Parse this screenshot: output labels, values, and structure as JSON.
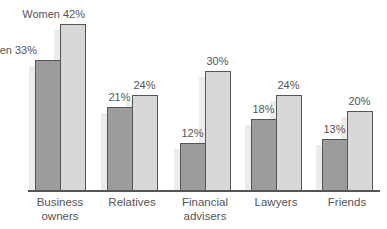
{
  "chart_data": {
    "type": "bar",
    "title": "",
    "xlabel": "",
    "ylabel": "",
    "categories": [
      "Business owners",
      "Relatives",
      "Financial advisers",
      "Lawyers",
      "Friends"
    ],
    "category_lines": [
      [
        "Business",
        "owners"
      ],
      [
        "Relatives",
        ""
      ],
      [
        "Financial",
        "advisers"
      ],
      [
        "Lawyers",
        ""
      ],
      [
        "Friends",
        ""
      ]
    ],
    "series": [
      {
        "name": "Men",
        "values": [
          33,
          21,
          12,
          18,
          13
        ],
        "color": "#9c9c9c"
      },
      {
        "name": "Women",
        "values": [
          42,
          24,
          30,
          24,
          20
        ],
        "color": "#d8d8d8"
      }
    ],
    "data_labels": [
      [
        "Men 33%",
        "21%",
        "12%",
        "18%",
        "13%"
      ],
      [
        "Women 42%",
        "24%",
        "30%",
        "24%",
        "20%"
      ]
    ],
    "ylim": [
      0,
      45
    ],
    "grid": false,
    "legend": "inline labels on first category"
  }
}
